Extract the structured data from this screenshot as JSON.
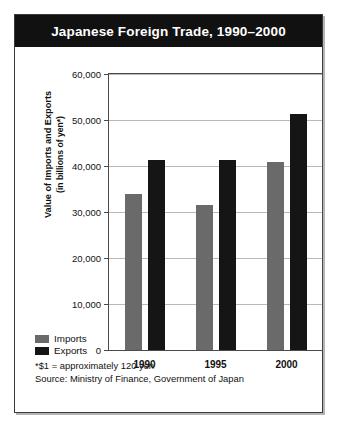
{
  "figure": {
    "title": "Japanese Foreign Trade, 1990–2000"
  },
  "legend": {
    "items": [
      {
        "label": "Imports",
        "color": "#6a6a6a",
        "swatch": "imports-swatch"
      },
      {
        "label": "Exports",
        "color": "#151515",
        "swatch": "exports-swatch"
      }
    ]
  },
  "notes": {
    "footnote": "*$1 = approximately 120 yen",
    "source": "Source: Ministry of Finance, Government of Japan"
  },
  "axis": {
    "y_title_line1": "Value of Imports and Exports",
    "y_title_line2": "(in billions of yen*)"
  },
  "chart_data": {
    "type": "bar",
    "title": "Japanese Foreign Trade, 1990–2000",
    "xlabel": "",
    "ylabel": "Value of Imports and Exports (in billions of yen*)",
    "categories": [
      "1990",
      "1995",
      "2000"
    ],
    "series": [
      {
        "name": "Imports",
        "color": "#6a6a6a",
        "values": [
          33900,
          31500,
          40900
        ]
      },
      {
        "name": "Exports",
        "color": "#151515",
        "values": [
          41300,
          41300,
          51300
        ]
      }
    ],
    "ylim": [
      0,
      60000
    ],
    "ytick_values": [
      0,
      10000,
      20000,
      30000,
      40000,
      50000,
      60000
    ],
    "ytick_labels": [
      "0",
      "10,000",
      "20,000",
      "30,000",
      "40,000",
      "50,000",
      "60,000"
    ],
    "grid": true,
    "legend_position": "bottom-left",
    "annotations": [
      "*$1 = approximately 120 yen",
      "Source: Ministry of Finance, Government of Japan"
    ]
  }
}
